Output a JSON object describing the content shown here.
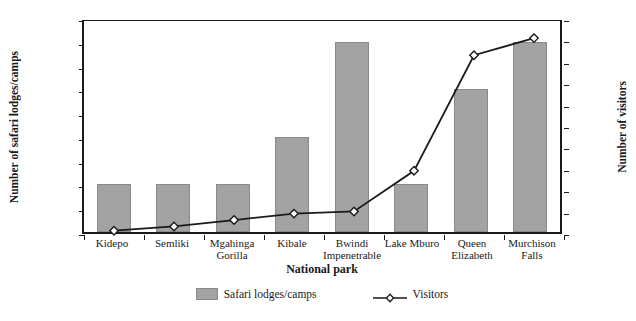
{
  "chart_data": {
    "type": "bar",
    "title": "",
    "xlabel": "National park",
    "categories": [
      "Kidepo",
      "Semliki",
      "Mgahinga Gorilla",
      "Kibale",
      "Bwindi Impenetrable",
      "Lake Mburo",
      "Queen Elizabeth",
      "Murchison Falls"
    ],
    "category_lines": [
      [
        "Kidepo"
      ],
      [
        "Semliki"
      ],
      [
        "Mgahinga",
        "Gorilla"
      ],
      [
        "Kibale"
      ],
      [
        "Bwindi",
        "Impenetrable"
      ],
      [
        "Lake Mburo"
      ],
      [
        "Queen",
        "Elizabeth"
      ],
      [
        "Murchison",
        "Falls"
      ]
    ],
    "series": [
      {
        "name": "Safari lodges/camps",
        "render": "bar",
        "axis": "left",
        "color": "#a3a3a3",
        "values": [
          1,
          1,
          1,
          2,
          4,
          1,
          3,
          4
        ]
      },
      {
        "name": "Visitors",
        "render": "line",
        "axis": "right",
        "color": "#1a1a1a",
        "marker": "diamond",
        "values": [
          1000,
          2000,
          3500,
          5000,
          5500,
          15000,
          42000,
          46000
        ]
      }
    ],
    "left_axis": {
      "label": "Number of safari lodges/camps",
      "ylim": [
        0,
        4.5
      ],
      "ticks": [
        0,
        0.5,
        1.0,
        1.5,
        2.0,
        2.5,
        3.0,
        3.5,
        4.0,
        4.5
      ],
      "tick_labels": [
        "0",
        "0.5",
        "1.0",
        "1.5",
        "2.0",
        "2.5",
        "3.0",
        "3.5",
        "4.0",
        "4.5"
      ]
    },
    "right_axis": {
      "label": "Number of visitors",
      "ylim": [
        0,
        50000
      ],
      "ticks": [
        0,
        5000,
        10000,
        15000,
        20000,
        25000,
        30000,
        35000,
        40000,
        45000,
        50000
      ],
      "tick_labels": [
        "0",
        "5000",
        "10000",
        "15000",
        "20000",
        "25000",
        "30000",
        "35000",
        "40000",
        "45000",
        "50000"
      ]
    },
    "grid": false,
    "legend_position": "bottom"
  },
  "legend": {
    "items": [
      {
        "label": "Safari lodges/camps",
        "marker": "swatch"
      },
      {
        "label": "Visitors",
        "marker": "line-diamond"
      }
    ]
  }
}
